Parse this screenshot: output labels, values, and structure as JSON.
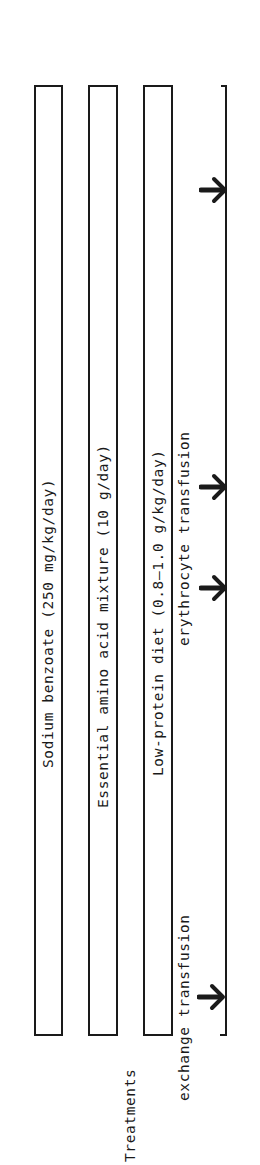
{
  "diagram": {
    "axis_label": "Treatments",
    "orientation": "rotated -90deg (timeline runs bottom-to-top)",
    "treatment_bars": [
      {
        "label": "Sodium benzoate (250 mg/kg/day)"
      },
      {
        "label": "Essential amino acid mixture (10 g/day)"
      },
      {
        "label": "Low-protein diet (0.8–1.0 g/kg/day)"
      }
    ],
    "events": [
      {
        "label": "exchange transfusion",
        "arrow_count": 1
      },
      {
        "label": "erythrocyte transfusion",
        "arrow_count": 2
      }
    ],
    "arrows": [
      {
        "name": "event-arrow",
        "icon": "arrow-right-icon"
      },
      {
        "name": "event-arrow",
        "icon": "arrow-right-icon"
      },
      {
        "name": "event-arrow",
        "icon": "arrow-right-icon"
      },
      {
        "name": "event-arrow",
        "icon": "arrow-right-icon"
      }
    ],
    "colors": {
      "ink": "#1a1a1a",
      "background": "#ffffff"
    }
  }
}
